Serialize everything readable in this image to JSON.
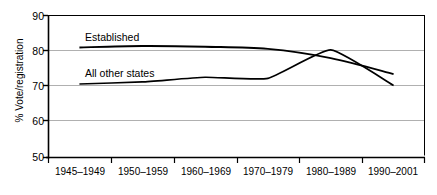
{
  "chart_data": {
    "type": "line",
    "title": "",
    "subtitle": "",
    "xlabel": "",
    "ylabel": "% Vote/registration",
    "categories": [
      "1945–1949",
      "1950–1959",
      "1960–1969",
      "1970–1979",
      "1980–1989",
      "1990–2001"
    ],
    "ylim": [
      50,
      90
    ],
    "yticks": [
      50,
      60,
      70,
      80,
      90
    ],
    "ytick_labels": [
      "50",
      "60",
      "70",
      "80",
      "90"
    ],
    "grid": true,
    "grid_axis": "y",
    "legend_position": "inline-annotation",
    "series": [
      {
        "name": "Established",
        "label": "Established",
        "color": "#000000",
        "values": [
          81.0,
          81.4,
          81.2,
          80.6,
          78.0,
          73.5
        ]
      },
      {
        "name": "All other states",
        "label": "All other states",
        "color": "#000000",
        "values": [
          70.7,
          71.3,
          72.6,
          72.3,
          80.3,
          70.3
        ]
      }
    ],
    "annotations": [
      {
        "text": "Established",
        "series": "Established"
      },
      {
        "text": "All other states",
        "series": "All other states"
      }
    ]
  },
  "style": {
    "axis_color": "#000000",
    "grid_color": "#b3b3b3",
    "line_color": "#000000",
    "background": "#ffffff"
  }
}
